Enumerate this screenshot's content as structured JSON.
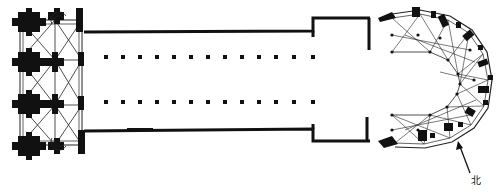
{
  "diagram": {
    "type": "architectural-floor-plan",
    "colors": {
      "ink": "#111111",
      "background": "#ffffff",
      "rib": "#222222"
    },
    "sections": [
      {
        "name": "westwork",
        "description": "west facade with twin towers, clustered piers and rib vaulting, spiral stairs"
      },
      {
        "name": "nave",
        "description": "long nave with two rows of piers"
      },
      {
        "name": "transept",
        "description": "short projecting transept walls"
      },
      {
        "name": "choir",
        "description": "choir with ambulatory and radiating chapels, rib vaulted apse"
      }
    ],
    "nave_pier_rows": 2,
    "nave_piers_per_row": 13,
    "compass": {
      "label": "北",
      "meaning": "north",
      "direction": "up-left"
    }
  }
}
